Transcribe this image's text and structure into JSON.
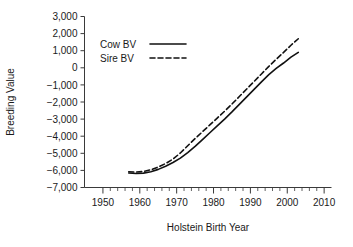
{
  "chart_data": {
    "type": "line",
    "title": "",
    "xlabel": "Holstein Birth Year",
    "ylabel": "Breeding Value",
    "xlim": [
      1945,
      2012
    ],
    "ylim": [
      -7000,
      3000
    ],
    "grid": false,
    "legend_position": "upper-left",
    "xticks": [
      1950,
      1960,
      1970,
      1980,
      1990,
      2000,
      2010
    ],
    "xtick_labels": [
      "1950",
      "1960",
      "1970",
      "1980",
      "1990",
      "2000",
      "2010"
    ],
    "xminor_tick_interval": 2,
    "yticks": [
      3000,
      2000,
      1000,
      0,
      -1000,
      -2000,
      -3000,
      -4000,
      -5000,
      -6000,
      -7000
    ],
    "ytick_labels": [
      "3,000",
      "2,000",
      "1,000",
      "0",
      "−1,000",
      "−2,000",
      "−3,000",
      "−4,000",
      "−5,000",
      "−6,000",
      "−7,000"
    ],
    "series": [
      {
        "name": "Cow BV",
        "style": "solid",
        "x": [
          1957,
          1959,
          1961,
          1963,
          1965,
          1967,
          1969,
          1971,
          1973,
          1975,
          1977,
          1979,
          1981,
          1983,
          1985,
          1987,
          1989,
          1991,
          1993,
          1995,
          1997,
          1999,
          2001,
          2003
        ],
        "y": [
          -6150,
          -6180,
          -6160,
          -6080,
          -5940,
          -5760,
          -5540,
          -5280,
          -4960,
          -4600,
          -4200,
          -3800,
          -3400,
          -3000,
          -2580,
          -2140,
          -1700,
          -1260,
          -820,
          -400,
          -40,
          280,
          620,
          900
        ]
      },
      {
        "name": "Sire BV",
        "style": "dashed",
        "x": [
          1957,
          1959,
          1961,
          1963,
          1965,
          1967,
          1969,
          1971,
          1973,
          1975,
          1977,
          1979,
          1981,
          1983,
          1985,
          1987,
          1989,
          1991,
          1993,
          1995,
          1997,
          1999,
          2001,
          2003
        ],
        "y": [
          -6080,
          -6100,
          -6060,
          -5960,
          -5800,
          -5600,
          -5340,
          -4980,
          -4560,
          -4140,
          -3740,
          -3340,
          -2940,
          -2540,
          -2120,
          -1680,
          -1240,
          -800,
          -360,
          80,
          500,
          900,
          1320,
          1700
        ]
      }
    ]
  },
  "legend": {
    "items": [
      {
        "label": "Cow BV",
        "style": "solid"
      },
      {
        "label": "Sire BV",
        "style": "dashed"
      }
    ]
  },
  "colors": {
    "background": "#ffffff",
    "axis": "#3a3a3a",
    "line": "#111111",
    "text": "#1a1a1a"
  }
}
